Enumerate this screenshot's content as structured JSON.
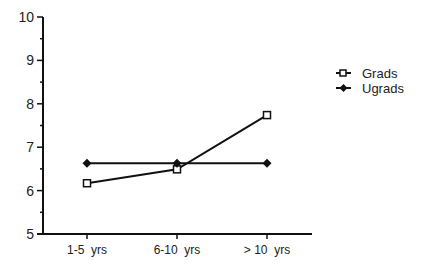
{
  "chart_data": {
    "type": "line",
    "title": "",
    "xlabel": "",
    "ylabel": "",
    "categories": [
      "1-5  yrs",
      "6-10  yrs",
      "> 10  yrs"
    ],
    "ylim": [
      5,
      10
    ],
    "yticks": [
      "5",
      "6",
      "7",
      "8",
      "9",
      "10"
    ],
    "grid": false,
    "legend_position": "right",
    "series": [
      {
        "name": "Grads",
        "marker": "open-square",
        "values": [
          6.17,
          6.49,
          7.74
        ]
      },
      {
        "name": "Ugrads",
        "marker": "filled-diamond",
        "values": [
          6.63,
          6.63,
          6.63
        ]
      }
    ]
  },
  "legend": {
    "items": [
      {
        "label": "Grads",
        "icon": "open-square-marker-icon"
      },
      {
        "label": "Ugrads",
        "icon": "filled-diamond-marker-icon"
      }
    ]
  }
}
